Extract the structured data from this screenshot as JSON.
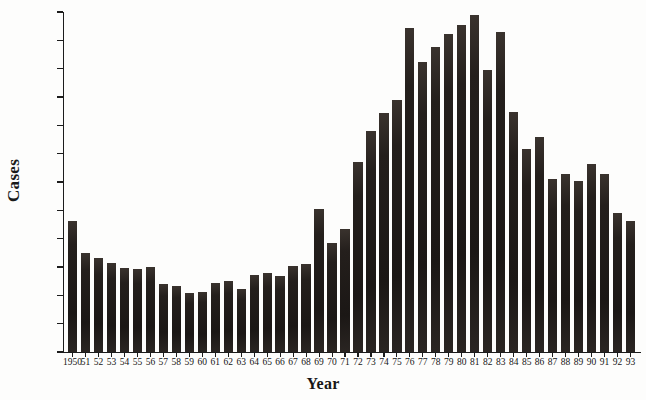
{
  "chart_data": {
    "type": "bar",
    "title": "",
    "xlabel": "Year",
    "ylabel": "Cases",
    "ylim": [
      0,
      1200
    ],
    "ytick_values": [
      0,
      100,
      200,
      300,
      400,
      500,
      600,
      700,
      800,
      900,
      1000,
      1100,
      1200
    ],
    "ytick_labels": [
      "0",
      "100",
      "200",
      "300",
      "400",
      "500",
      "600",
      "700",
      "800",
      "900",
      "1000",
      "1100",
      "1200"
    ],
    "grid": false,
    "legend": null,
    "bar_color": "#241f1c",
    "categories": [
      "1950",
      "51",
      "52",
      "53",
      "54",
      "55",
      "56",
      "57",
      "58",
      "59",
      "60",
      "61",
      "62",
      "63",
      "64",
      "65",
      "66",
      "67",
      "68",
      "69",
      "70",
      "71",
      "72",
      "73",
      "74",
      "75",
      "76",
      "77",
      "78",
      "79",
      "80",
      "81",
      "82",
      "83",
      "84",
      "85",
      "86",
      "87",
      "88",
      "89",
      "90",
      "91",
      "92",
      "93"
    ],
    "values": [
      462,
      350,
      331,
      315,
      295,
      293,
      300,
      240,
      233,
      207,
      212,
      245,
      252,
      222,
      272,
      280,
      268,
      305,
      310,
      505,
      385,
      435,
      672,
      780,
      842,
      890,
      1142,
      1022,
      1075,
      1122,
      1155,
      1190,
      995,
      1130,
      848,
      715,
      758,
      612,
      628,
      605,
      663,
      628,
      490,
      462
    ]
  },
  "axes": {
    "y_title": "Cases",
    "x_title": "Year"
  }
}
